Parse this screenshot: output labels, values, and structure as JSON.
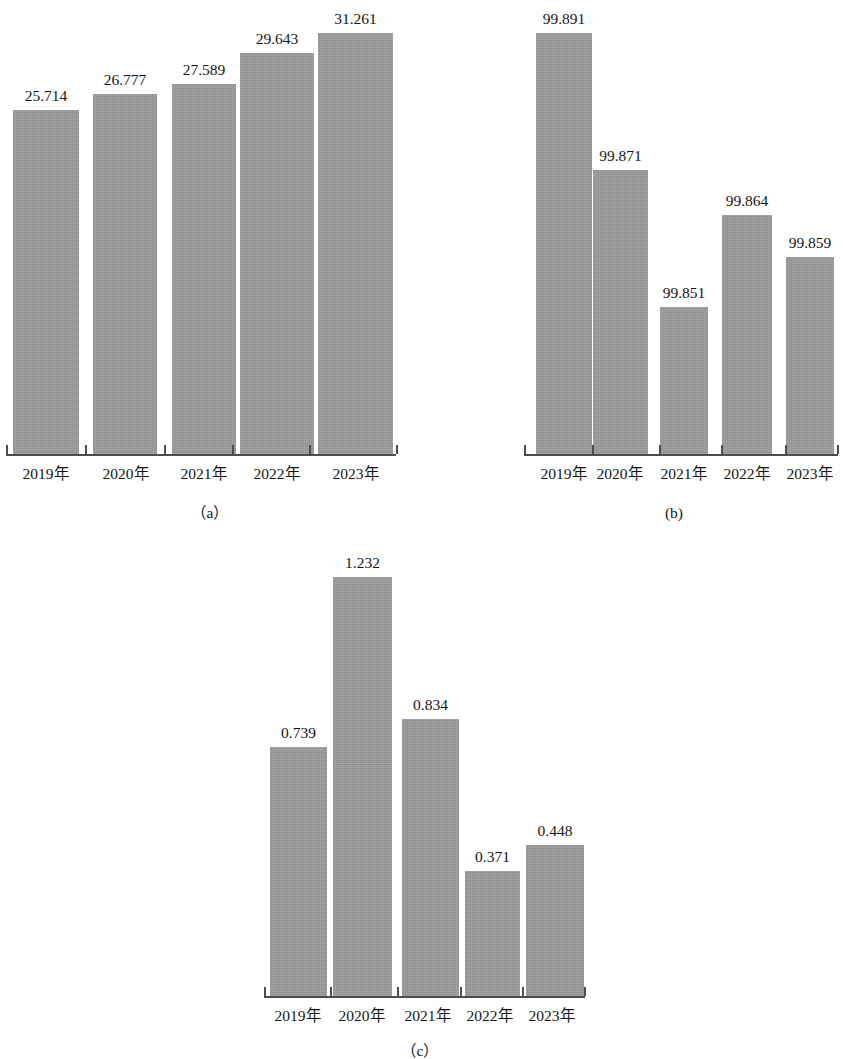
{
  "figure": {
    "background_color": "#ffffff",
    "bar_color": "#9b9b9b",
    "axis_color": "#4d4d4d",
    "text_color": "#161616"
  },
  "chart_data": [
    {
      "id": "a",
      "type": "bar",
      "title": "",
      "caption": "（a）",
      "xlabel": "",
      "ylabel": "",
      "grid": false,
      "legend": "none",
      "categories": [
        "2019年",
        "2020年",
        "2021年",
        "2022年",
        "2023年"
      ],
      "values": [
        25.714,
        26.777,
        27.589,
        29.643,
        31.261
      ],
      "value_labels": [
        "25.714",
        "26.777",
        "27.589",
        "29.643",
        "31.261"
      ],
      "ylim": [
        0,
        33.5
      ]
    },
    {
      "id": "b",
      "type": "bar",
      "title": "",
      "caption": "(b)",
      "xlabel": "",
      "ylabel": "",
      "grid": false,
      "legend": "none",
      "categories": [
        "2019年",
        "2020年",
        "2021年",
        "2022年",
        "2023年"
      ],
      "values": [
        99.891,
        99.871,
        99.851,
        99.864,
        99.859
      ],
      "value_labels": [
        "99.891",
        "99.871",
        "99.851",
        "99.864",
        "99.859"
      ],
      "ylim": [
        99.8395,
        99.8935
      ]
    },
    {
      "id": "c",
      "type": "bar",
      "title": "",
      "caption": "（c）",
      "xlabel": "",
      "ylabel": "",
      "grid": false,
      "legend": "none",
      "categories": [
        "2019年",
        "2020年",
        "2021年",
        "2022年",
        "2023年"
      ],
      "values": [
        0.739,
        1.232,
        0.834,
        0.371,
        0.448
      ],
      "value_labels": [
        "0.739",
        "1.232",
        "0.834",
        "0.371",
        "0.448"
      ],
      "ylim": [
        0,
        1.34
      ]
    }
  ]
}
